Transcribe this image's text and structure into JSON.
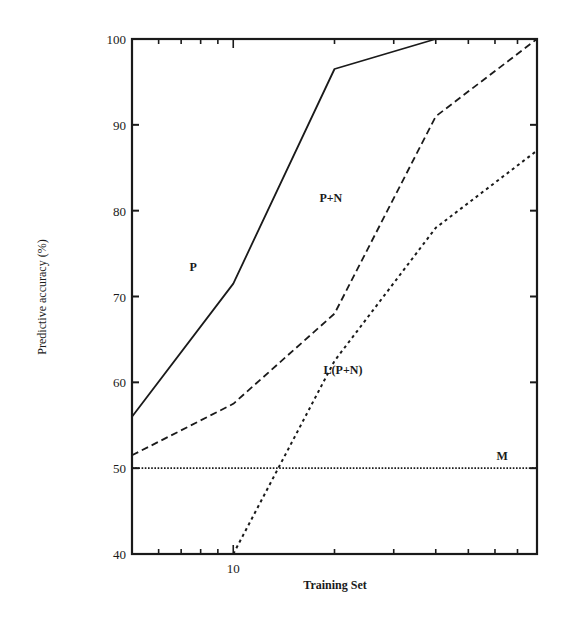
{
  "chart_data": {
    "type": "line",
    "title": "",
    "xlabel": "Training Set",
    "ylabel": "Predictive accuracy (%)",
    "xscale": "log",
    "xlim": [
      5,
      80
    ],
    "ylim": [
      40,
      100
    ],
    "grid": false,
    "legend": "inline labels",
    "x_tick_labels": [
      {
        "value": 10,
        "label": "10"
      }
    ],
    "x_minor_ticks": [
      6,
      7,
      8,
      9,
      10,
      20,
      30,
      40,
      50,
      60,
      70
    ],
    "y_ticks": [
      40,
      50,
      60,
      70,
      80,
      90,
      100
    ],
    "y_tick_labels": [
      "40",
      "50",
      "60",
      "70",
      "80",
      "90",
      "100"
    ],
    "series": [
      {
        "name": "P",
        "style": "solid",
        "x": [
          5,
          10,
          20,
          40,
          80
        ],
        "values": [
          56,
          71.5,
          96.5,
          100,
          100
        ],
        "label_pos": {
          "x": 7.6,
          "y": 73
        }
      },
      {
        "name": "P+N",
        "style": "dashed",
        "x": [
          5,
          10,
          20,
          40,
          80
        ],
        "values": [
          51.5,
          57.5,
          68,
          91,
          100
        ],
        "label_pos": {
          "x": 19.5,
          "y": 81
        }
      },
      {
        "name": "L(P+N)",
        "style": "dotted",
        "x": [
          10,
          20,
          40,
          80
        ],
        "values": [
          40,
          62.5,
          78,
          87
        ],
        "label_pos": {
          "x": 21.2,
          "y": 61
        }
      },
      {
        "name": "M",
        "style": "fine-dotted",
        "x": [
          5,
          80
        ],
        "values": [
          50,
          50
        ],
        "label_pos": {
          "x": 63,
          "y": 51
        }
      }
    ]
  }
}
